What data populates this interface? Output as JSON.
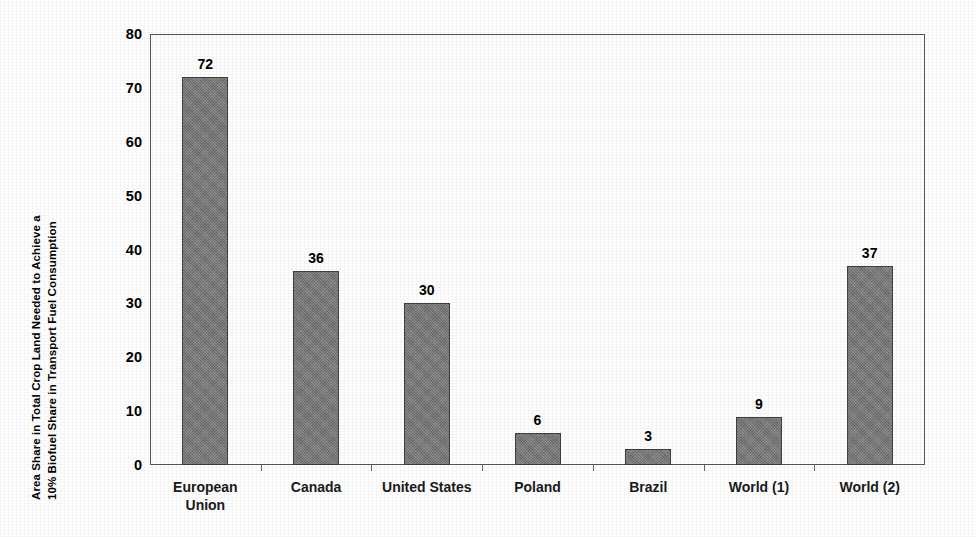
{
  "chart_data": {
    "type": "bar",
    "title": "",
    "subtitle": "",
    "xlabel": "",
    "ylabel_line1": "Area Share in Total Crop Land Needed to Achieve a",
    "ylabel_line2": "10%  Biofuel Share in Transport Fuel Consumption",
    "categories": [
      "European\nUnion",
      "Canada",
      "United States",
      "Poland",
      "Brazil",
      "World (1)",
      "World (2)"
    ],
    "values": [
      72,
      36,
      30,
      6,
      3,
      9,
      37
    ],
    "data_labels": [
      "72",
      "36",
      "30",
      "6",
      "3",
      "9",
      "37"
    ],
    "ylim": [
      0,
      80
    ],
    "ytick_labels": [
      "0",
      "10",
      "20",
      "30",
      "40",
      "50",
      "60",
      "70",
      "80"
    ],
    "ytick_values": [
      0,
      10,
      20,
      30,
      40,
      50,
      60,
      70,
      80
    ],
    "grid": false,
    "legend": false,
    "legend_position": "none",
    "bar_color": "#787878",
    "bar_border_color": "#3f3f3f",
    "axis_color": "#58585a",
    "text_color": "#000000",
    "background_color": "#ffffff"
  }
}
